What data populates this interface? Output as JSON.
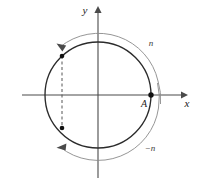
{
  "figure": {
    "background_color": "#ffffff",
    "axes": {
      "x_label": "x",
      "y_label": "y",
      "axis_color": "#4a4a4a",
      "origin": {
        "x": 98,
        "y": 95
      },
      "x_start": {
        "x": 22,
        "y": 95
      },
      "x_end": {
        "x": 183,
        "y": 95
      },
      "y_start": {
        "x": 98,
        "y": 178
      },
      "y_end": {
        "x": 98,
        "y": 10
      }
    },
    "main_circle": {
      "name": "unit-circle",
      "center_x": 98,
      "center_y": 95,
      "radius": 53,
      "stroke_color": "#2b2b2b",
      "stroke_width": 1.3
    },
    "outer_arc_upper": {
      "name": "winding-arc-positive",
      "label": "n",
      "label_x": 150,
      "label_y": 43,
      "radius": 60,
      "stroke_color": "#8a8a8a",
      "stroke_width": 0.9
    },
    "outer_arc_lower": {
      "name": "winding-arc-negative",
      "label": "−n",
      "label_x": 148,
      "label_y": 148,
      "radius": 60,
      "stroke_color": "#8a8a8a",
      "stroke_width": 0.9
    },
    "point_A": {
      "name": "point-a",
      "label": "A",
      "x": 151,
      "y": 95,
      "label_x": 143,
      "label_y": 106,
      "marker_color": "#111111",
      "marker_radius": 2.6
    },
    "marked_point_upper": {
      "name": "upper-marked-point",
      "x": 62,
      "y": 56,
      "marker_color": "#111111",
      "marker_radius": 2.2
    },
    "marked_point_lower": {
      "name": "lower-marked-point",
      "x": 62,
      "y": 128,
      "marker_color": "#111111",
      "marker_radius": 2.2
    },
    "dashed_connector": {
      "name": "dashed-chord",
      "x": 62,
      "y_top": 56,
      "y_bottom": 128,
      "stroke_color": "#555555",
      "dash_pattern": "3,2.5"
    },
    "arrow_upper": {
      "name": "upper-arrowhead",
      "tip_x": 57,
      "tip_y": 43
    },
    "arrow_lower": {
      "name": "lower-arrowhead",
      "tip_x": 57,
      "tip_y": 148
    }
  }
}
